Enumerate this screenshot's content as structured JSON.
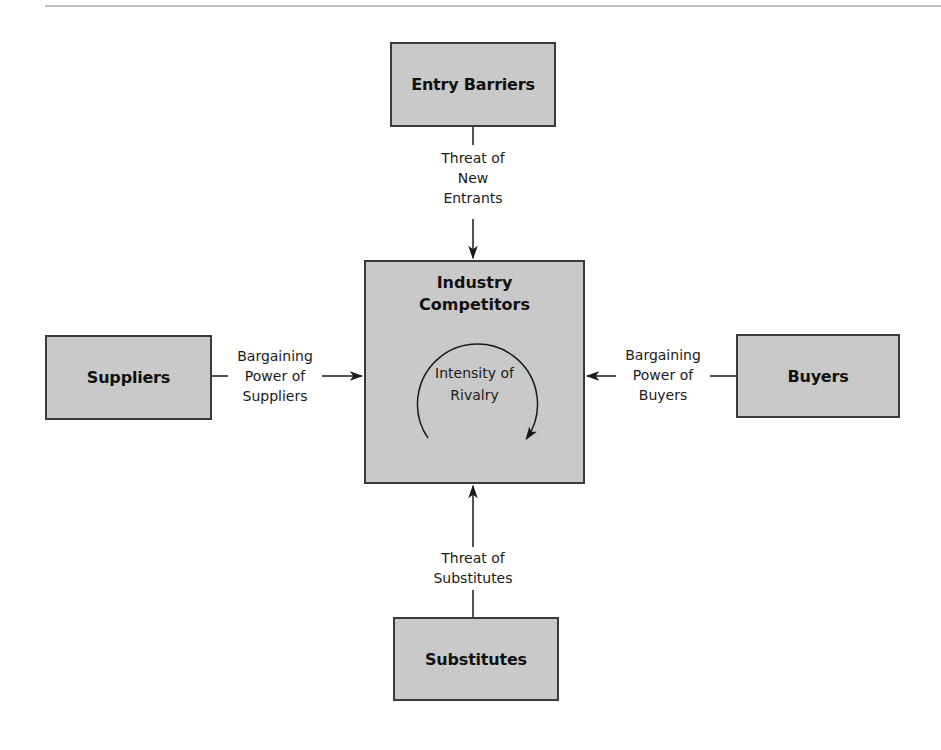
{
  "diagram": {
    "type": "porter-five-forces",
    "boxes": {
      "entry_barriers": "Entry Barriers",
      "industry_competitors": "Industry Competitors",
      "suppliers": "Suppliers",
      "buyers": "Buyers",
      "substitutes": "Substitutes"
    },
    "center_sublabel_line1": "Intensity of",
    "center_sublabel_line2": "Rivalry",
    "center_title_line1": "Industry",
    "center_title_line2": "Competitors",
    "forces": {
      "new_entrants": [
        "Threat of",
        "New",
        "Entrants"
      ],
      "suppliers": [
        "Bargaining",
        "Power of",
        "Suppliers"
      ],
      "buyers": [
        "Bargaining",
        "Power of",
        "Buyers"
      ],
      "substitutes": [
        "Threat of",
        "Substitutes"
      ]
    },
    "colors": {
      "box_fill": "#c9c9c9",
      "box_border": "#3a3a3a",
      "line": "#1a1a1a",
      "background": "#ffffff"
    }
  }
}
